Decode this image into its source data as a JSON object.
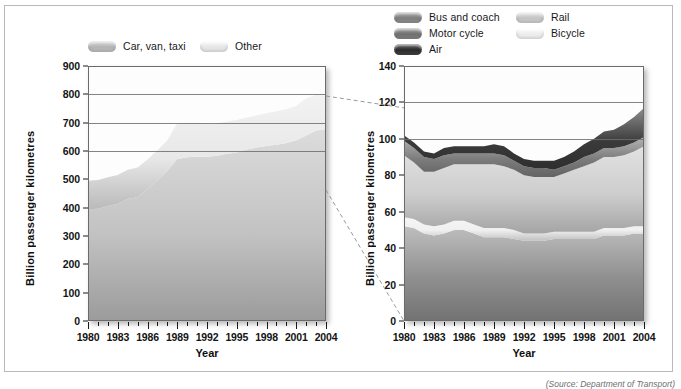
{
  "figure": {
    "source_note": "(Source: Department of Transport)",
    "background": "#ffffff",
    "frame_color": "#b9b9b9"
  },
  "left_legend": {
    "items": [
      {
        "label": "Car, van, taxi",
        "color": "#b9b9b9",
        "swatch_name": "swatch-car-van-taxi"
      },
      {
        "label": "Other",
        "color": "#ececec",
        "swatch_name": "swatch-other"
      }
    ]
  },
  "right_legend": {
    "items": [
      {
        "label": "Bus and coach",
        "color": "#8c8c8c",
        "swatch_name": "swatch-bus-and-coach"
      },
      {
        "label": "Motor cycle",
        "color": "#7e7e7e",
        "swatch_name": "swatch-motor-cycle"
      },
      {
        "label": "Air",
        "color": "#3d3d3d",
        "swatch_name": "swatch-air"
      },
      {
        "label": "Rail",
        "color": "#cfcfcf",
        "swatch_name": "swatch-rail"
      },
      {
        "label": "Bicycle",
        "color": "#f2f2f2",
        "swatch_name": "swatch-bicycle"
      }
    ]
  },
  "chart_data": [
    {
      "id": "left",
      "type": "area",
      "stacked": true,
      "title": "",
      "xlabel": "Year",
      "ylabel": "Billion passenger kilometres",
      "xlim": [
        1980,
        2004
      ],
      "ylim": [
        0,
        900
      ],
      "ytick_step": 100,
      "yticks": [
        0,
        100,
        200,
        300,
        400,
        500,
        600,
        700,
        800,
        900
      ],
      "xticks": [
        1980,
        1983,
        1986,
        1989,
        1992,
        1995,
        1998,
        2001,
        2004
      ],
      "x": [
        1980,
        1981,
        1982,
        1983,
        1984,
        1985,
        1986,
        1987,
        1988,
        1989,
        1990,
        1991,
        1992,
        1993,
        1994,
        1995,
        1996,
        1997,
        1998,
        1999,
        2000,
        2001,
        2002,
        2003,
        2004
      ],
      "grid": true,
      "gridlines": [
        600,
        700,
        800
      ],
      "legend_position": "above",
      "series": [
        {
          "name": "Car, van, taxi",
          "color": "#c2c2c2",
          "values": [
            394,
            396,
            406,
            414,
            431,
            438,
            465,
            497,
            530,
            572,
            578,
            580,
            580,
            583,
            590,
            595,
            605,
            612,
            618,
            622,
            628,
            638,
            655,
            672,
            678
          ]
        },
        {
          "name": "Other",
          "color": "#e8e8e8",
          "values": [
            101,
            102,
            101,
            101,
            103,
            104,
            105,
            106,
            108,
            126,
            122,
            120,
            117,
            115,
            114,
            114,
            113,
            113,
            115,
            118,
            119,
            121,
            131,
            126,
            117
          ]
        }
      ],
      "totals": [
        495,
        498,
        507,
        515,
        534,
        542,
        570,
        603,
        638,
        698,
        700,
        700,
        697,
        698,
        704,
        709,
        718,
        725,
        733,
        740,
        747,
        759,
        786,
        798,
        795
      ]
    },
    {
      "id": "right",
      "type": "area",
      "stacked": true,
      "title": "",
      "xlabel": "Year",
      "ylabel": "Billion passenger kilometres",
      "xlim": [
        1980,
        2004
      ],
      "ylim": [
        0,
        140
      ],
      "ytick_step": 20,
      "yticks": [
        0,
        20,
        40,
        60,
        80,
        100,
        120,
        140
      ],
      "xticks": [
        1980,
        1983,
        1986,
        1989,
        1992,
        1995,
        1998,
        2001,
        2004
      ],
      "x": [
        1980,
        1981,
        1982,
        1983,
        1984,
        1985,
        1986,
        1987,
        1988,
        1989,
        1990,
        1991,
        1992,
        1993,
        1994,
        1995,
        1996,
        1997,
        1998,
        1999,
        2000,
        2001,
        2002,
        2003,
        2004
      ],
      "grid": true,
      "gridlines": [
        100,
        120
      ],
      "legend_position": "above",
      "series": [
        {
          "name": "Bus and coach",
          "color": "#8f8f8f",
          "values": [
            52,
            51,
            48,
            47,
            48,
            50,
            50,
            48,
            46,
            46,
            46,
            45,
            44,
            44,
            44,
            45,
            45,
            45,
            45,
            45,
            47,
            47,
            47,
            48,
            48
          ]
        },
        {
          "name": "Bicycle",
          "color": "#f0f0f0",
          "values": [
            5,
            5,
            5,
            5,
            5,
            5,
            5,
            5,
            5,
            5,
            5,
            5,
            4,
            4,
            4,
            4,
            4,
            4,
            4,
            4,
            4,
            4,
            4,
            4,
            4
          ]
        },
        {
          "name": "Rail",
          "color": "#cdcdcd",
          "values": [
            34,
            31,
            29,
            30,
            31,
            31,
            31,
            33,
            35,
            35,
            34,
            33,
            32,
            31,
            31,
            30,
            32,
            34,
            36,
            38,
            39,
            39,
            40,
            41,
            44
          ]
        },
        {
          "name": "Motor cycle",
          "color": "#7c7c7c",
          "values": [
            8,
            8,
            8,
            7,
            7,
            6,
            6,
            6,
            6,
            6,
            6,
            5,
            5,
            5,
            5,
            4,
            4,
            4,
            5,
            5,
            5,
            5,
            5,
            5,
            5
          ]
        },
        {
          "name": "Air",
          "color": "#3a3a3a",
          "values": [
            3,
            3,
            3,
            3,
            4,
            4,
            4,
            4,
            4,
            5,
            5,
            4,
            4,
            4,
            4,
            5,
            5,
            6,
            7,
            8,
            9,
            10,
            12,
            14,
            16
          ]
        }
      ],
      "totals": [
        102,
        98,
        93,
        92,
        95,
        96,
        96,
        96,
        96,
        97,
        96,
        92,
        89,
        88,
        88,
        88,
        90,
        93,
        97,
        100,
        104,
        105,
        108,
        112,
        117
      ]
    }
  ],
  "connectors": {
    "name": "callout-dashed-lines",
    "color": "#9a9a9a",
    "style": "dashed"
  }
}
